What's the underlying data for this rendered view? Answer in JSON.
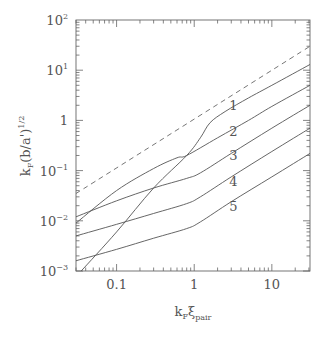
{
  "chart_data": {
    "type": "line",
    "title": "",
    "xlabel": "k_F ξ_pair",
    "ylabel": "k_F (b/a')^{1/2}",
    "xscale": "log",
    "yscale": "log",
    "xlim": [
      0.03,
      31
    ],
    "ylim": [
      0.001,
      100
    ],
    "grid": false,
    "x_ticks": [
      {
        "value": 0.1,
        "label": "0.1"
      },
      {
        "value": 1,
        "label": "1"
      },
      {
        "value": 10,
        "label": "10"
      }
    ],
    "y_ticks": [
      {
        "value": 100,
        "label": "10",
        "sup": "2"
      },
      {
        "value": 10,
        "label": "10",
        "sup": "1"
      },
      {
        "value": 1,
        "label": "1",
        "sup": ""
      },
      {
        "value": 0.1,
        "label": "10",
        "sup": "−1"
      },
      {
        "value": 0.01,
        "label": "10",
        "sup": "−2"
      },
      {
        "value": 0.001,
        "label": "10",
        "sup": "−3"
      }
    ],
    "series": [
      {
        "name": "dashed",
        "style": "dashed",
        "x": [
          0.03,
          31
        ],
        "y": [
          0.035,
          30
        ]
      },
      {
        "name": "1",
        "x": [
          0.035,
          0.1,
          0.3,
          0.8,
          1.2,
          1.6,
          2.5,
          5,
          10,
          31
        ],
        "y": [
          0.001,
          0.006,
          0.045,
          0.2,
          0.45,
          0.9,
          1.5,
          2.8,
          5,
          13
        ]
      },
      {
        "name": "2",
        "x": [
          0.03,
          0.1,
          0.3,
          0.6,
          0.8,
          2,
          5,
          10,
          31
        ],
        "y": [
          0.009,
          0.04,
          0.11,
          0.18,
          0.2,
          0.45,
          1.0,
          1.9,
          5
        ]
      },
      {
        "name": "3",
        "x": [
          0.03,
          0.1,
          0.3,
          0.8,
          1.2,
          3,
          10,
          31
        ],
        "y": [
          0.012,
          0.025,
          0.045,
          0.07,
          0.09,
          0.22,
          0.7,
          2
        ]
      },
      {
        "name": "4",
        "x": [
          0.03,
          0.1,
          0.3,
          0.8,
          1.2,
          3,
          10,
          31
        ],
        "y": [
          0.005,
          0.0085,
          0.014,
          0.022,
          0.03,
          0.075,
          0.24,
          0.7
        ]
      },
      {
        "name": "5",
        "x": [
          0.03,
          0.1,
          0.3,
          0.8,
          1.2,
          3,
          10,
          31
        ],
        "y": [
          0.0016,
          0.0027,
          0.0045,
          0.007,
          0.0095,
          0.024,
          0.075,
          0.22
        ]
      }
    ],
    "annotations": [
      {
        "text": "1",
        "x": 3.2,
        "y": 1.6
      },
      {
        "text": "2",
        "x": 3.2,
        "y": 0.5
      },
      {
        "text": "3",
        "x": 3.2,
        "y": 0.16
      },
      {
        "text": "4",
        "x": 3.2,
        "y": 0.05
      },
      {
        "text": "5",
        "x": 3.2,
        "y": 0.016
      }
    ]
  }
}
